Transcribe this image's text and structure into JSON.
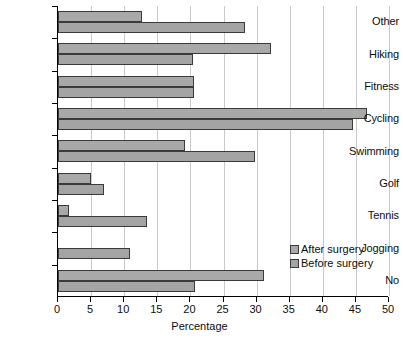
{
  "chart_data": {
    "type": "bar",
    "orientation": "horizontal",
    "title": "",
    "xlabel": "Percentage",
    "ylabel": "",
    "xlim": [
      0,
      50
    ],
    "xticks": [
      0,
      5,
      10,
      15,
      20,
      25,
      30,
      35,
      40,
      45,
      50
    ],
    "grid": "vertical",
    "legend_position": "inside-right",
    "categories": [
      "Other",
      "Hiking",
      "Fitness",
      "Cycling",
      "Swimming",
      "Golf",
      "Tennis",
      "Jogging",
      "No"
    ],
    "series": [
      {
        "name": "After surgery",
        "color": "#a9a9a9",
        "values": [
          12.7,
          32.2,
          20.5,
          46.7,
          19.2,
          5.0,
          1.7,
          0.0,
          31.1
        ]
      },
      {
        "name": "Before surgery",
        "color": "#a4a4a4",
        "values": [
          28.2,
          20.4,
          20.5,
          44.6,
          29.8,
          6.9,
          13.4,
          10.9,
          20.7
        ]
      }
    ]
  },
  "axis": {
    "x_tick_labels": [
      "0",
      "5",
      "10",
      "15",
      "20",
      "25",
      "30",
      "35",
      "40",
      "45",
      "50"
    ],
    "x_title": "Percentage"
  },
  "legend": {
    "items": [
      {
        "label": "After surgery"
      },
      {
        "label": "Before surgery"
      }
    ]
  }
}
